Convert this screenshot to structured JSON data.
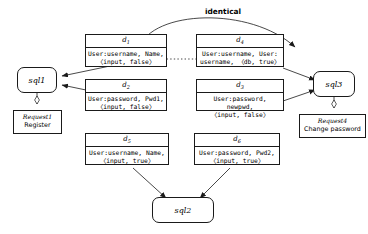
{
  "diagram": {
    "title_label": "identical",
    "attribute_nodes": [
      {
        "id": "d1",
        "label": "d",
        "subscript": "1",
        "body": "User:username, Name,\n〈input, false〉"
      },
      {
        "id": "d4",
        "label": "d",
        "subscript": "4",
        "body": "User:username, User:\nusername, 〈db, true〉"
      },
      {
        "id": "d2",
        "label": "d",
        "subscript": "2",
        "body": "User:password, Pwd1,\n〈input, false〉"
      },
      {
        "id": "d3",
        "label": "d",
        "subscript": "3",
        "body": "User:password, newpwd,\n〈input, false〉"
      },
      {
        "id": "d5",
        "label": "d",
        "subscript": "5",
        "body": "User:username, Name,\n〈input, true〉"
      },
      {
        "id": "d6",
        "label": "d",
        "subscript": "6",
        "body": "User:password, Pwd2,\n〈input, true〉"
      }
    ],
    "sql_nodes": [
      {
        "id": "sql1",
        "label": "sql1"
      },
      {
        "id": "sql3",
        "label": "sql3"
      },
      {
        "id": "sql2",
        "label": "sql2"
      }
    ],
    "request_nodes": [
      {
        "id": "request1",
        "title": "Request1",
        "description": "Register"
      },
      {
        "id": "request4",
        "title": "Request4",
        "description": "Change password"
      }
    ],
    "colors": {
      "stroke": "#1a1a1a",
      "background": "#ffffff",
      "text": "#000000"
    }
  }
}
